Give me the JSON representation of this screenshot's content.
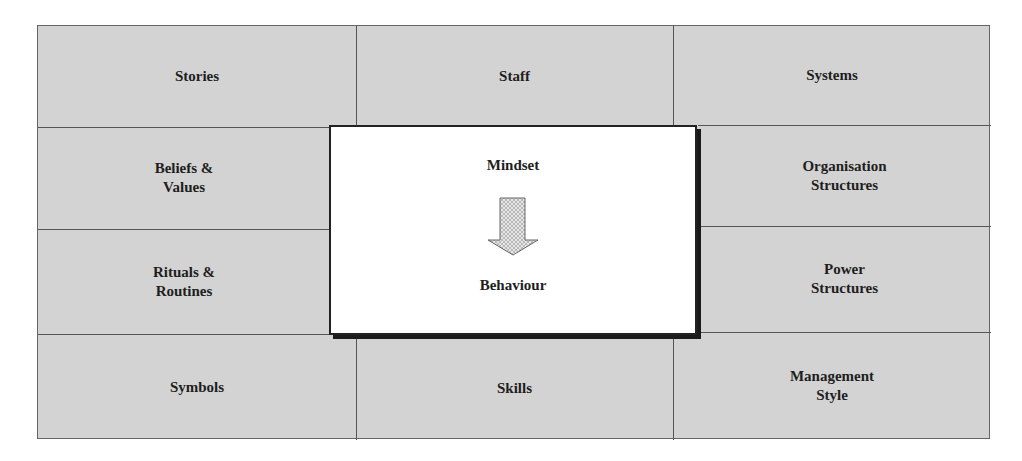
{
  "diagram": {
    "type": "culture-web-grid",
    "top_row": [
      {
        "label": "Stories"
      },
      {
        "label": "Staff"
      },
      {
        "label": "Systems"
      }
    ],
    "left_column": [
      {
        "label": "Beliefs &\nValues",
        "line1": "Beliefs &",
        "line2": "Values"
      },
      {
        "label": "Rituals &\nRoutines",
        "line1": "Rituals &",
        "line2": "Routines"
      }
    ],
    "right_column": [
      {
        "label": "Organisation\nStructures",
        "line1": "Organisation",
        "line2": "Structures"
      },
      {
        "label": "Power\nStructures",
        "line1": "Power",
        "line2": "Structures"
      }
    ],
    "bottom_row": [
      {
        "label": "Symbols"
      },
      {
        "label": "Skills"
      },
      {
        "label": "Management\nStyle",
        "line1": "Management",
        "line2": "Style"
      }
    ],
    "center": {
      "top_label": "Mindset",
      "bottom_label": "Behaviour",
      "arrow": "down-arrow-icon"
    },
    "colors": {
      "cell_fill": "#d3d3d3",
      "grid_line": "#555555",
      "center_fill": "#ffffff",
      "center_border": "#222222",
      "text": "#1e1e1e"
    }
  }
}
